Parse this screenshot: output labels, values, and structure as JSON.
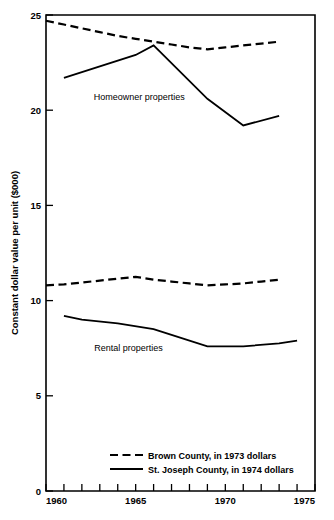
{
  "chart_data": {
    "type": "line",
    "title": "",
    "subtitle": "",
    "xlabel": "",
    "ylabel": "Constant dollar value per unit ($000)",
    "xlim": [
      1960,
      1975
    ],
    "ylim": [
      0,
      25
    ],
    "xticks": [
      1960,
      1961,
      1962,
      1963,
      1964,
      1965,
      1966,
      1967,
      1968,
      1969,
      1970,
      1971,
      1972,
      1973,
      1974,
      1975
    ],
    "xtick_labels": [
      "1960",
      "",
      "",
      "",
      "",
      "1965",
      "",
      "",
      "",
      "",
      "1970",
      "",
      "",
      "",
      "",
      "1975"
    ],
    "yticks": [
      0,
      5,
      10,
      15,
      20,
      25
    ],
    "ytick_labels": [
      "0",
      "5",
      "10",
      "15",
      "20",
      "25"
    ],
    "grid": false,
    "legend_position": "inside-bottom-center",
    "annotations": [
      {
        "text": "Homeowner properties",
        "x": 1965.2,
        "y": 20.55
      },
      {
        "text": "Rental properties",
        "x": 1964.6,
        "y": 7.35
      }
    ],
    "series": [
      {
        "name": "Brown County, in 1973 dollars",
        "style": "dashed",
        "group": "Homeowner properties",
        "x": [
          1960,
          1961,
          1962,
          1963,
          1964,
          1965,
          1966,
          1967,
          1968,
          1969,
          1970,
          1971,
          1972,
          1973
        ],
        "values": [
          24.7,
          24.5,
          24.3,
          24.1,
          23.9,
          23.75,
          23.6,
          23.45,
          23.3,
          23.2,
          23.3,
          23.4,
          23.5,
          23.6
        ]
      },
      {
        "name": "St. Joseph County, in 1974 dollars",
        "style": "solid",
        "group": "Homeowner properties",
        "x": [
          1961,
          1965,
          1966,
          1969,
          1971,
          1973
        ],
        "values": [
          21.7,
          22.9,
          23.4,
          20.6,
          19.2,
          19.7
        ]
      },
      {
        "name": "Brown County, in 1973 dollars",
        "style": "dashed",
        "group": "Rental properties",
        "x": [
          1960,
          1961,
          1962,
          1963,
          1964,
          1965,
          1966,
          1967,
          1968,
          1969,
          1970,
          1971,
          1972,
          1973
        ],
        "values": [
          10.8,
          10.85,
          10.95,
          11.05,
          11.15,
          11.25,
          11.1,
          11.0,
          10.9,
          10.8,
          10.85,
          10.9,
          11.0,
          11.1
        ]
      },
      {
        "name": "St. Joseph County, in 1974 dollars",
        "style": "solid",
        "group": "Rental properties",
        "x": [
          1961,
          1962,
          1964,
          1966,
          1967,
          1969,
          1971,
          1973,
          1974
        ],
        "values": [
          9.2,
          9.0,
          8.8,
          8.5,
          8.2,
          7.6,
          7.6,
          7.75,
          7.9
        ]
      }
    ],
    "legend": [
      {
        "label": "Brown County, in 1973 dollars",
        "style": "dashed"
      },
      {
        "label": "St. Joseph County, in 1974 dollars",
        "style": "solid"
      }
    ]
  }
}
